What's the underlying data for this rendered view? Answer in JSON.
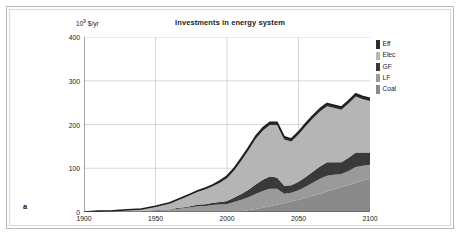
{
  "figure": {
    "panel_label": "a",
    "title": "Investments in energy system",
    "y_unit_mantissa": "10",
    "y_unit_exponent": "9",
    "y_unit_suffix": " $/yr"
  },
  "legend": {
    "position": "top-right-outside",
    "items": [
      {
        "label": "Eff",
        "color": "#2b2b2b"
      },
      {
        "label": "Elec",
        "color": "#b5b5b5"
      },
      {
        "label": "GF",
        "color": "#3a3a3a"
      },
      {
        "label": "LF",
        "color": "#9a9a9a"
      },
      {
        "label": "Coal",
        "color": "#8a8a8a"
      }
    ]
  },
  "chart_data": {
    "type": "area",
    "stacked": true,
    "title": "Investments in energy system",
    "xlabel": "",
    "ylabel": "10^9 $/yr",
    "xlim": [
      1900,
      2100
    ],
    "ylim": [
      0,
      400
    ],
    "xticks": [
      1900,
      1950,
      2000,
      2050,
      2100
    ],
    "yticks": [
      0,
      100,
      200,
      300,
      400
    ],
    "grid": "both",
    "x": [
      1900,
      1910,
      1920,
      1930,
      1940,
      1950,
      1955,
      1960,
      1965,
      1970,
      1975,
      1980,
      1985,
      1990,
      1995,
      2000,
      2005,
      2010,
      2015,
      2020,
      2025,
      2030,
      2035,
      2040,
      2045,
      2050,
      2055,
      2060,
      2065,
      2070,
      2075,
      2080,
      2085,
      2090,
      2095,
      2100
    ],
    "series": [
      {
        "name": "Coal",
        "color": "#8a8a8a",
        "values": [
          0,
          0,
          0,
          0,
          0,
          0,
          0,
          0,
          0,
          0,
          0,
          0,
          0,
          0,
          0,
          0,
          1,
          2,
          4,
          7,
          10,
          13,
          17,
          20,
          24,
          28,
          32,
          37,
          42,
          47,
          52,
          57,
          62,
          67,
          72,
          76
        ]
      },
      {
        "name": "LF",
        "color": "#9a9a9a",
        "values": [
          0,
          1,
          1,
          2,
          2,
          3,
          4,
          5,
          7,
          9,
          11,
          13,
          14,
          16,
          17,
          18,
          22,
          26,
          30,
          34,
          38,
          40,
          36,
          22,
          20,
          22,
          26,
          30,
          34,
          36,
          33,
          30,
          32,
          36,
          34,
          32
        ]
      },
      {
        "name": "GF",
        "color": "#3a3a3a",
        "values": [
          0,
          0,
          0,
          0,
          0,
          1,
          1,
          1,
          2,
          2,
          3,
          4,
          4,
          5,
          6,
          7,
          10,
          13,
          17,
          22,
          26,
          28,
          26,
          18,
          17,
          19,
          22,
          25,
          28,
          31,
          29,
          27,
          30,
          33,
          30,
          28
        ]
      },
      {
        "name": "Elec",
        "color": "#b5b5b5",
        "values": [
          0,
          1,
          2,
          3,
          5,
          8,
          11,
          14,
          18,
          22,
          26,
          30,
          34,
          38,
          44,
          52,
          62,
          76,
          90,
          104,
          112,
          118,
          120,
          106,
          100,
          108,
          116,
          122,
          126,
          128,
          124,
          120,
          124,
          128,
          122,
          118
        ]
      },
      {
        "name": "Eff",
        "color": "#2b2b2b",
        "values": [
          0,
          0,
          0,
          0,
          0,
          1,
          1,
          1,
          1,
          2,
          2,
          2,
          3,
          3,
          4,
          5,
          5,
          6,
          6,
          6,
          6,
          6,
          6,
          6,
          6,
          6,
          6,
          6,
          6,
          6,
          6,
          6,
          6,
          6,
          6,
          6
        ]
      }
    ]
  }
}
